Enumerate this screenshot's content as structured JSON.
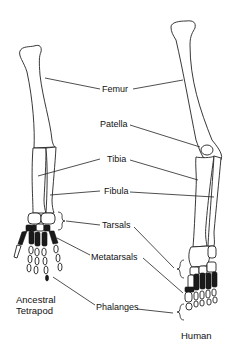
{
  "diagram": {
    "type": "anatomical-comparison",
    "labels": [
      {
        "id": "femur",
        "text": "Femur"
      },
      {
        "id": "patella",
        "text": "Patella"
      },
      {
        "id": "tibia",
        "text": "Tibia"
      },
      {
        "id": "fibula",
        "text": "Fibula"
      },
      {
        "id": "tarsals",
        "text": "Tarsals"
      },
      {
        "id": "metatarsals",
        "text": "Metatarsals"
      },
      {
        "id": "phalanges",
        "text": "Phalanges"
      }
    ],
    "specimens": {
      "left": {
        "line1": "Ancestral",
        "line2": "Tetrapod"
      },
      "right": {
        "line1": "Human"
      }
    },
    "colors": {
      "line": "#222222",
      "background": "#ffffff",
      "dark_bones": "#1a1a1a"
    }
  }
}
